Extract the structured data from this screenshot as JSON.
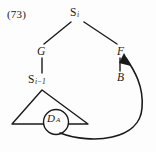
{
  "figure": {
    "example_number": "(73)",
    "type": "syntax-tree",
    "ink_color": "#1a1a1a",
    "background_color": "#fdfdfd"
  },
  "nodes": {
    "root": {
      "label": "S",
      "subscript": "i"
    },
    "left_child": {
      "label": "G"
    },
    "right_child": {
      "label": "F"
    },
    "right_grandchild": {
      "label": "B"
    },
    "left_grandchild": {
      "label": "S",
      "subscript": "i−1"
    },
    "circled": {
      "label": "D",
      "subscript": "A"
    }
  },
  "edges": [
    {
      "from": "S_i",
      "to": "G"
    },
    {
      "from": "S_i",
      "to": "F"
    },
    {
      "from": "G",
      "to": "S_i-1"
    },
    {
      "from": "F",
      "to": "B"
    },
    {
      "from": "S_i-1",
      "to": "triangle"
    }
  ],
  "movement_arrow": {
    "from": "D_A",
    "to": "F",
    "style": "curved",
    "arrowhead": "solid"
  },
  "triangle": {
    "label": "elided-constituent-triangle"
  }
}
